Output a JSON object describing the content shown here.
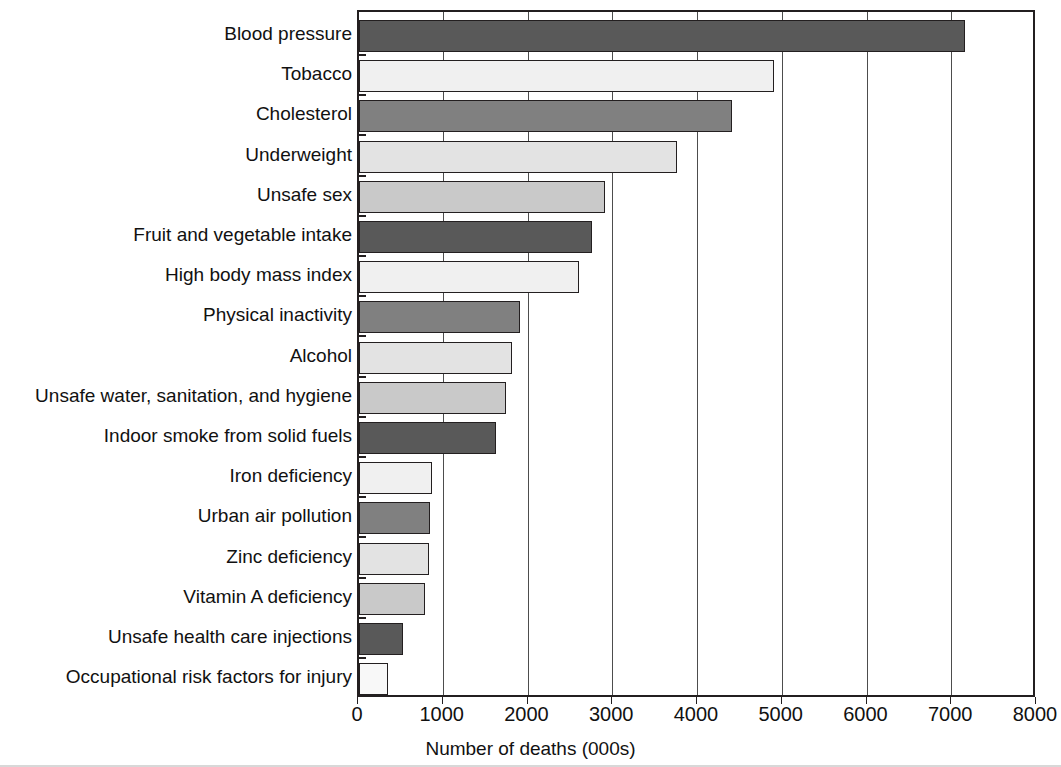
{
  "chart_data": {
    "type": "bar",
    "orientation": "horizontal",
    "title": "",
    "xlabel": "Number of deaths (000s)",
    "ylabel": "",
    "xlim": [
      0,
      8000
    ],
    "xticks": [
      "0",
      "1000",
      "2000",
      "3000",
      "4000",
      "5000",
      "6000",
      "7000",
      "8000"
    ],
    "grid": "vertical",
    "legend": "none",
    "categories": [
      "Blood pressure",
      "Tobacco",
      "Cholesterol",
      "Underweight",
      "Unsafe sex",
      "Fruit and vegetable intake",
      "High body mass index",
      "Physical inactivity",
      "Alcohol",
      "Unsafe water, sanitation, and hygiene",
      "Indoor smoke from solid fuels",
      "Iron deficiency",
      "Urban air pollution",
      "Zinc deficiency",
      "Vitamin A deficiency",
      "Unsafe health care injections",
      "Occupational risk factors for injury"
    ],
    "values": [
      7150,
      4900,
      4400,
      3750,
      2900,
      2750,
      2600,
      1900,
      1800,
      1730,
      1620,
      860,
      840,
      830,
      780,
      520,
      340
    ],
    "bar_colors": [
      "#595959",
      "#f0f0f0",
      "#808080",
      "#e3e3e3",
      "#c9c9c9",
      "#595959",
      "#f0f0f0",
      "#808080",
      "#e3e3e3",
      "#c9c9c9",
      "#595959",
      "#f0f0f0",
      "#808080",
      "#e3e3e3",
      "#c9c9c9",
      "#595959",
      "#f8f8f8"
    ]
  },
  "axis": {
    "frame_color": "#231f20",
    "grid_color": "#4d4d4d"
  }
}
